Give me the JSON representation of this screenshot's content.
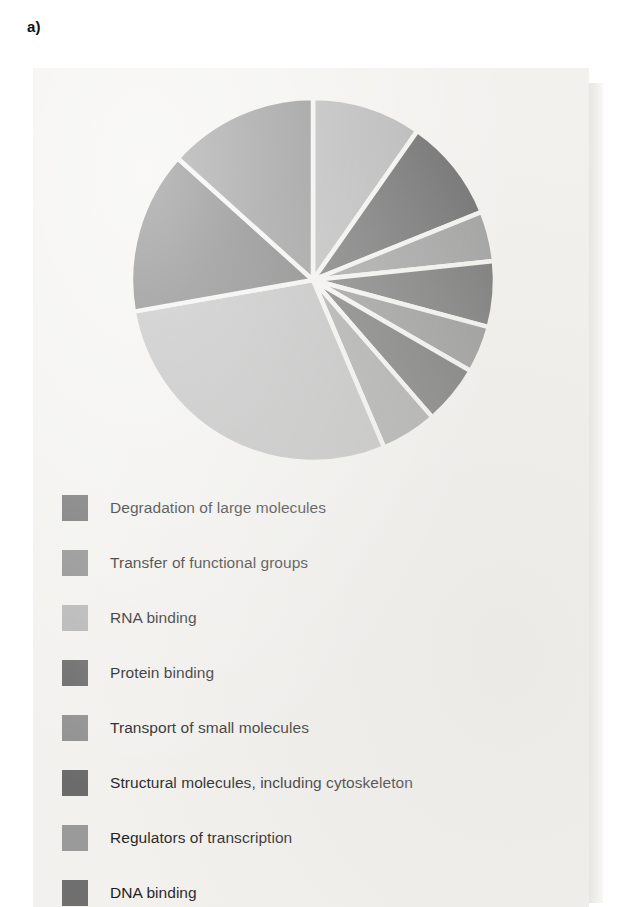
{
  "panel": {
    "label": "a)",
    "background_color": "#f2f1ee",
    "page_color": "#ffffff"
  },
  "chart_data": {
    "type": "pie",
    "title": "",
    "subtitle": "",
    "xlabel": "",
    "ylabel": "",
    "grid": false,
    "legend_position": "below",
    "start_angle_deg": 0,
    "direction": "clockwise",
    "units": "percent of genes",
    "categories": [
      "RNA binding",
      "Protein binding",
      "Transport of small molecules",
      "Structural molecules, including cytoskeleton",
      "Regulators of transcription",
      "DNA binding",
      "Transfer of functional groups",
      "Degradation of large molecules"
    ],
    "slices": [
      {
        "label": "RNA binding",
        "value": 9.7,
        "color": "#b4b4b4",
        "start_deg": 0.0,
        "end_deg": 35.0
      },
      {
        "label": "Protein binding",
        "value": 9.2,
        "color": "#686868",
        "start_deg": 35.0,
        "end_deg": 68.0
      },
      {
        "label": "Regulators of transcription",
        "value": 4.4,
        "color": "#9a9a9a",
        "start_deg": 68.0,
        "end_deg": 84.0
      },
      {
        "label": "DNA binding",
        "value": 5.8,
        "color": "#6f6f6f",
        "start_deg": 84.0,
        "end_deg": 105.0
      },
      {
        "label": "Transport of small molecules",
        "value": 4.2,
        "color": "#909090",
        "start_deg": 105.0,
        "end_deg": 120.0
      },
      {
        "label": "Structural molecules, including cytoskeleton",
        "value": 5.3,
        "color": "#6b6b6b",
        "start_deg": 120.0,
        "end_deg": 139.0
      },
      {
        "label": "Regulators of transcription",
        "value": 5.0,
        "color": "#a0a0a0",
        "start_deg": 139.0,
        "end_deg": 157.0
      },
      {
        "label": "RNA binding",
        "value": 28.6,
        "color": "#b8b8b8",
        "start_deg": 157.0,
        "end_deg": 260.0
      },
      {
        "label": "Degradation of large molecules",
        "value": 14.4,
        "color": "#6d6d6d",
        "start_deg": 260.0,
        "end_deg": 312.0
      },
      {
        "label": "Transfer of functional groups",
        "value": 13.3,
        "color": "#8b8b8b",
        "start_deg": 312.0,
        "end_deg": 360.0
      }
    ],
    "geometry": {
      "center_x": 280,
      "center_y": 212,
      "radius": 182
    }
  },
  "legend": {
    "items": [
      {
        "label": "Degradation of large molecules",
        "color": "#6d6d6d"
      },
      {
        "label": "Transfer of functional groups",
        "color": "#8b8b8b"
      },
      {
        "label": "RNA binding",
        "color": "#b4b4b4"
      },
      {
        "label": "Protein binding",
        "color": "#686868"
      },
      {
        "label": "Transport of small molecules",
        "color": "#909090"
      },
      {
        "label": "Structural molecules, including cytoskeleton",
        "color": "#6b6b6b"
      },
      {
        "label": "Regulators of transcription",
        "color": "#9a9a9a"
      },
      {
        "label": "DNA binding",
        "color": "#6f6f6f"
      }
    ]
  }
}
